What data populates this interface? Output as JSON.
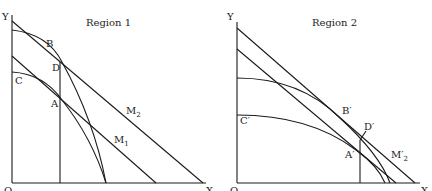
{
  "figure": {
    "panels": [
      {
        "id": "region-1",
        "title": "Region 1",
        "axes": {
          "origin": "O",
          "x": "X",
          "y": "Y"
        },
        "points": {
          "B": "B",
          "D": "D",
          "C": "C",
          "A": "A"
        },
        "lines": {
          "M2": "M",
          "M2_sub": "2",
          "M1": "M",
          "M1_sub": "1"
        }
      },
      {
        "id": "region-2",
        "title": "Region 2",
        "axes": {
          "origin": "O",
          "x": "X",
          "y": "Y"
        },
        "points": {
          "B": "B′",
          "D": "D′",
          "C": "C′",
          "A": "A′"
        },
        "lines": {
          "M2": "M′",
          "M2_sub": "2"
        }
      }
    ],
    "colors": {
      "ink": "#1a1a1a",
      "background": "#ffffff"
    }
  }
}
